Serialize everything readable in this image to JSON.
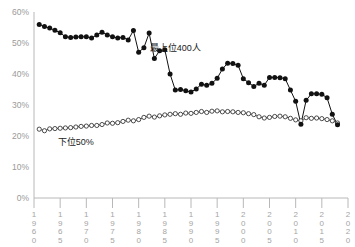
{
  "chart_data": {
    "type": "line",
    "title": "",
    "subtitle": "",
    "xlabel": "",
    "ylabel": "",
    "xlim": [
      1960,
      2020
    ],
    "ylim": [
      0,
      60
    ],
    "grid": false,
    "legend_position": "inline-annotation",
    "y_tick_labels": [
      "60%",
      "50%",
      "40%",
      "30%",
      "20%",
      "10%",
      "0%"
    ],
    "y_tick_values": [
      60,
      50,
      40,
      30,
      20,
      10,
      0
    ],
    "x_tick_labels": [
      "1960",
      "1965",
      "1970",
      "1975",
      "1980",
      "1985",
      "1990",
      "1995",
      "2000",
      "2005",
      "2010",
      "2015",
      "2020"
    ],
    "x_tick_values": [
      1960,
      1965,
      1970,
      1975,
      1980,
      1985,
      1990,
      1995,
      2000,
      2005,
      2010,
      2015,
      2020
    ],
    "annotations": [
      {
        "text": "最上位400人",
        "x": 1987,
        "y": 47.5
      },
      {
        "text": "下位50%",
        "x": 1968,
        "y": 17.0
      }
    ],
    "series": [
      {
        "name": "最上位400人",
        "marker": "filled-circle",
        "color": "#111111",
        "x": [
          1961,
          1962,
          1963,
          1964,
          1965,
          1966,
          1967,
          1968,
          1969,
          1970,
          1971,
          1972,
          1973,
          1974,
          1975,
          1976,
          1977,
          1978,
          1979,
          1980,
          1981,
          1982,
          1983,
          1984,
          1985,
          1986,
          1987,
          1988,
          1989,
          1990,
          1991,
          1992,
          1993,
          1994,
          1995,
          1996,
          1997,
          1998,
          1999,
          2000,
          2001,
          2002,
          2003,
          2004,
          2005,
          2006,
          2007,
          2008,
          2009,
          2010,
          2011,
          2012,
          2013,
          2014,
          2015,
          2016,
          2017,
          2018
        ],
        "values": [
          56.0,
          55.3,
          54.8,
          54.1,
          53.3,
          52.0,
          51.8,
          51.9,
          52.0,
          52.0,
          51.6,
          52.6,
          53.5,
          52.6,
          52.0,
          51.6,
          51.8,
          51.0,
          54.0,
          47.0,
          48.5,
          53.2,
          45.0,
          47.5,
          47.8,
          40.0,
          34.8,
          35.0,
          34.6,
          34.2,
          35.2,
          36.7,
          36.4,
          37.0,
          38.6,
          41.6,
          43.5,
          43.4,
          42.8,
          38.5,
          37.2,
          36.0,
          37.0,
          36.4,
          38.9,
          38.9,
          38.8,
          38.5,
          34.8,
          31.2,
          23.8,
          31.5,
          33.6,
          33.6,
          33.5,
          32.3,
          27.0,
          23.6
        ]
      },
      {
        "name": "下位50%",
        "marker": "open-circle",
        "color": "#222222",
        "x": [
          1961,
          1962,
          1963,
          1964,
          1965,
          1966,
          1967,
          1968,
          1969,
          1970,
          1971,
          1972,
          1973,
          1974,
          1975,
          1976,
          1977,
          1978,
          1979,
          1980,
          1981,
          1982,
          1983,
          1984,
          1985,
          1986,
          1987,
          1988,
          1989,
          1990,
          1991,
          1992,
          1993,
          1994,
          1995,
          1996,
          1997,
          1998,
          1999,
          2000,
          2001,
          2002,
          2003,
          2004,
          2005,
          2006,
          2007,
          2008,
          2009,
          2010,
          2011,
          2012,
          2013,
          2014,
          2015,
          2016,
          2017,
          2018
        ],
        "values": [
          22.2,
          21.7,
          22.3,
          22.4,
          22.5,
          22.6,
          22.7,
          22.9,
          23.1,
          23.2,
          23.4,
          23.4,
          23.7,
          24.2,
          24.1,
          24.3,
          24.7,
          25.1,
          24.9,
          25.3,
          26.0,
          26.4,
          26.1,
          26.5,
          26.8,
          27.0,
          27.2,
          27.0,
          27.4,
          27.3,
          27.6,
          27.9,
          27.6,
          28.0,
          28.1,
          27.8,
          27.9,
          27.8,
          27.6,
          27.5,
          27.2,
          26.9,
          26.2,
          25.8,
          26.0,
          26.3,
          26.4,
          26.2,
          25.7,
          25.2,
          24.9,
          25.9,
          25.7,
          25.8,
          25.6,
          25.3,
          24.9,
          24.2
        ]
      }
    ]
  }
}
